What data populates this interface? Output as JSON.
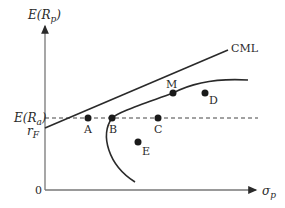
{
  "diagram": {
    "type": "capital-market-line",
    "axes": {
      "y_label_main": "E(R",
      "y_label_sub": "p",
      "y_label_close": ")",
      "x_label_main": "σ",
      "x_label_sub": "p",
      "origin_label": "0"
    },
    "levels": {
      "expected_return_a_main": "E(R",
      "expected_return_a_sub": "a",
      "expected_return_a_close": ")",
      "risk_free_main": "r",
      "risk_free_sub": "F"
    },
    "lines": {
      "cml_label": "CML"
    },
    "points": [
      {
        "id": "A",
        "label": "A"
      },
      {
        "id": "B",
        "label": "B"
      },
      {
        "id": "M",
        "label": "M"
      },
      {
        "id": "C",
        "label": "C"
      },
      {
        "id": "D",
        "label": "D"
      },
      {
        "id": "E",
        "label": "E"
      }
    ],
    "colors": {
      "ink": "#2a2a2a",
      "background": "#ffffff"
    }
  }
}
